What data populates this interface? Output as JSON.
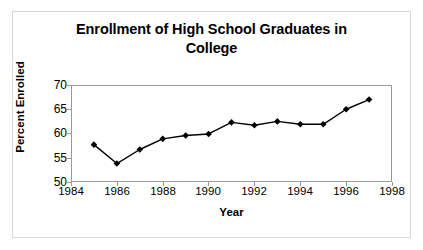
{
  "chart_data": {
    "type": "line",
    "title": "Enrollment of High School Graduates in College",
    "title_line1": "Enrollment of High School Graduates in",
    "title_line2": "College",
    "xlabel": "Year",
    "ylabel": "Percent Enrolled",
    "x": [
      1985,
      1986,
      1987,
      1988,
      1989,
      1990,
      1991,
      1992,
      1993,
      1994,
      1995,
      1996,
      1997
    ],
    "values": [
      57.7,
      53.8,
      56.7,
      58.9,
      59.6,
      59.9,
      62.3,
      61.7,
      62.5,
      61.9,
      61.9,
      65.0,
      67.0
    ],
    "xlim": [
      1984,
      1998
    ],
    "ylim": [
      50,
      70
    ],
    "xticks": [
      1984,
      1986,
      1988,
      1990,
      1992,
      1994,
      1996,
      1998
    ],
    "yticks": [
      70,
      65,
      60,
      55,
      50
    ],
    "xtick_labels": [
      "1984",
      "1986",
      "1988",
      "1990",
      "1992",
      "1994",
      "1996",
      "1998"
    ],
    "ytick_labels": [
      "70",
      "65",
      "60",
      "55",
      "50"
    ],
    "grid": false,
    "legend": false,
    "series_color": "#000000",
    "marker": "diamond",
    "frame_color": "#9a9a9a",
    "background_color": "#ffffff"
  }
}
